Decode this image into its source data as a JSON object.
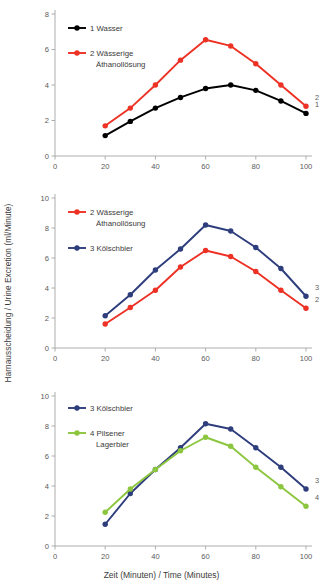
{
  "figure": {
    "ylabel": "Harnausscheidung / Urine Excretion (ml/Minute)",
    "xlabel": "Zeit (Minuten) / Time (Minutes)"
  },
  "colors": {
    "wasser": "#000000",
    "ethanol": "#ED3124",
    "koelsch": "#2E3D7C",
    "pilsener": "#8CC63E",
    "axis": "#9a9a9a",
    "text": "#3a3a3a"
  },
  "chart_data": [
    {
      "type": "line",
      "title": "",
      "xlabel": "",
      "ylabel": "Harnausscheidung / Urine Excretion (ml/Minute)",
      "x": [
        20,
        30,
        40,
        50,
        60,
        70,
        80,
        90,
        100
      ],
      "xlim": [
        0,
        100
      ],
      "ylim": [
        0,
        8
      ],
      "xticks": [
        0,
        20,
        40,
        60,
        80,
        100
      ],
      "yticks": [
        0,
        2,
        4,
        6,
        8
      ],
      "grid": false,
      "legend_position": "upper-left",
      "series": [
        {
          "name": "1 Wasser",
          "end_label": "1",
          "color": "#000000",
          "values": [
            1.15,
            1.95,
            2.7,
            3.3,
            3.8,
            4.0,
            3.7,
            3.1,
            2.4
          ]
        },
        {
          "name": "2 Wässerige Äthanollösung",
          "end_label": "2",
          "color": "#ED3124",
          "values": [
            1.7,
            2.7,
            4.0,
            5.4,
            6.55,
            6.2,
            5.2,
            4.0,
            2.8
          ]
        }
      ]
    },
    {
      "type": "line",
      "title": "",
      "xlabel": "",
      "ylabel": "Harnausscheidung / Urine Excretion (ml/Minute)",
      "x": [
        20,
        30,
        40,
        50,
        60,
        70,
        80,
        90,
        100
      ],
      "xlim": [
        0,
        100
      ],
      "ylim": [
        0,
        10
      ],
      "xticks": [
        0,
        20,
        40,
        60,
        80,
        100
      ],
      "yticks": [
        0,
        2,
        4,
        6,
        8,
        10
      ],
      "grid": false,
      "legend_position": "upper-left",
      "series": [
        {
          "name": "2 Wässerige Äthanollösung",
          "end_label": "2",
          "color": "#ED3124",
          "values": [
            1.6,
            2.7,
            3.85,
            5.4,
            6.5,
            6.1,
            5.1,
            3.85,
            2.65
          ]
        },
        {
          "name": "3 Kölschbier",
          "end_label": "3",
          "color": "#2E3D7C",
          "values": [
            2.15,
            3.55,
            5.2,
            6.6,
            8.2,
            7.8,
            6.7,
            5.3,
            3.45
          ]
        }
      ]
    },
    {
      "type": "line",
      "title": "",
      "xlabel": "Zeit (Minuten) / Time (Minutes)",
      "ylabel": "Harnausscheidung / Urine Excretion (ml/Minute)",
      "x": [
        20,
        30,
        40,
        50,
        60,
        70,
        80,
        90,
        100
      ],
      "xlim": [
        0,
        100
      ],
      "ylim": [
        0,
        10
      ],
      "xticks": [
        0,
        20,
        40,
        60,
        80,
        100
      ],
      "yticks": [
        0,
        2,
        4,
        6,
        8,
        10
      ],
      "grid": false,
      "legend_position": "upper-left",
      "series": [
        {
          "name": "3 Kölschbier",
          "end_label": "3",
          "color": "#2E3D7C",
          "values": [
            1.45,
            3.5,
            5.1,
            6.55,
            8.15,
            7.8,
            6.55,
            5.25,
            3.8
          ]
        },
        {
          "name": "4 Pilsener Lagerbier",
          "end_label": "4",
          "color": "#8CC63E",
          "values": [
            2.25,
            3.8,
            5.1,
            6.35,
            7.25,
            6.65,
            5.25,
            3.95,
            2.65
          ]
        }
      ]
    }
  ],
  "legends": [
    [
      {
        "label_lines": [
          "1 Wasser"
        ],
        "color": "#000000"
      },
      {
        "label_lines": [
          "2 Wässerige",
          "Äthanollösung"
        ],
        "color": "#ED3124"
      }
    ],
    [
      {
        "label_lines": [
          "2 Wässerige",
          "Äthanollösung"
        ],
        "color": "#ED3124"
      },
      {
        "label_lines": [
          "3 Kölschbier"
        ],
        "color": "#2E3D7C"
      }
    ],
    [
      {
        "label_lines": [
          "3 Kölschbier"
        ],
        "color": "#2E3D7C"
      },
      {
        "label_lines": [
          "4 Pilsener",
          "Lagerbier"
        ],
        "color": "#8CC63E"
      }
    ]
  ]
}
